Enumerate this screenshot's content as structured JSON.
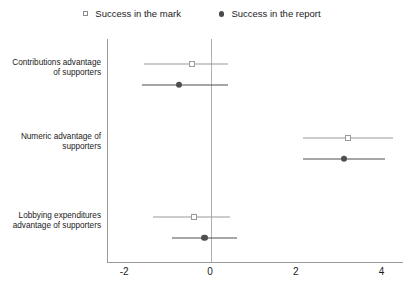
{
  "chart_data": {
    "type": "scatter",
    "subtype": "coefficient-forest-plot",
    "title": "",
    "xlabel": "",
    "ylabel": "",
    "xlim": [
      -2.4,
      4.5
    ],
    "xticks": [
      -2,
      0,
      2,
      4
    ],
    "xtick_labels": [
      "-2",
      "0",
      "2",
      "4"
    ],
    "grid": false,
    "reference_line": 0,
    "legend_position": "top-center",
    "categories": [
      "Contributions advantage of supporters",
      "Numeric advantage of supporters",
      "Lobbying expenditures advantage of supporters"
    ],
    "category_lines": [
      [
        "Contributions advantage",
        "of supporters"
      ],
      [
        "Numeric advantage of",
        "supporters"
      ],
      [
        "Lobbying expenditures",
        "advantage of supporters"
      ]
    ],
    "series": [
      {
        "name": "Success in the mark",
        "marker": "open-square",
        "color": "#9a9a9a",
        "values": [
          -0.45,
          3.2,
          -0.4
        ],
        "ci_low": [
          -1.55,
          2.15,
          -1.35
        ],
        "ci_high": [
          0.4,
          4.25,
          0.45
        ]
      },
      {
        "name": "Success in the report",
        "marker": "filled-circle",
        "color": "#4f4f4f",
        "values": [
          -0.75,
          3.1,
          -0.15
        ],
        "ci_low": [
          -1.6,
          2.15,
          -0.9
        ],
        "ci_high": [
          0.4,
          4.05,
          0.6
        ]
      }
    ]
  },
  "legend": {
    "entries": [
      {
        "label": "Success in the mark",
        "marker": "open-square-icon"
      },
      {
        "label": "Success in the report",
        "marker": "filled-circle-icon"
      }
    ]
  },
  "axis": {
    "ticks": [
      {
        "label": "-2",
        "value": -2
      },
      {
        "label": "0",
        "value": 0
      },
      {
        "label": "2",
        "value": 2
      },
      {
        "label": "4",
        "value": 4
      }
    ]
  }
}
